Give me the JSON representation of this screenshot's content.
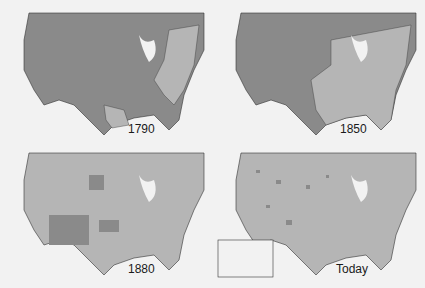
{
  "panels": [
    {
      "label": "1790",
      "x": 4,
      "y": 10
    },
    {
      "label": "1850",
      "x": 216,
      "y": 10
    },
    {
      "label": "1880",
      "x": 4,
      "y": 150
    },
    {
      "label": "Today",
      "x": 216,
      "y": 150
    }
  ],
  "colors": {
    "dark": "#8a8a8a",
    "light": "#b5b5b5",
    "water": "#f2f2f2",
    "border": "#333333"
  },
  "inset": {
    "name": "Alaska and Hawaii"
  }
}
